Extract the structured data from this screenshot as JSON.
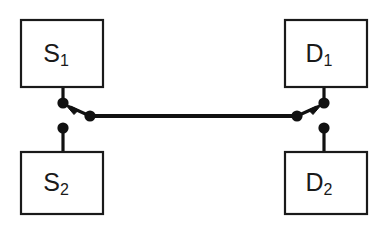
{
  "diagram": {
    "type": "schematic-switch-network",
    "background_color": "#ffffff",
    "line_color": "#111111",
    "box_stroke_color": "#1a1a1a",
    "box_fill_color": "#ffffff",
    "nodes": [
      {
        "id": "s1",
        "label_base": "S",
        "label_sub": "1",
        "label_full": "S1",
        "role": "source",
        "position": "top-left",
        "x": 21,
        "y": 20,
        "width": 82,
        "height": 67
      },
      {
        "id": "d1",
        "label_base": "D",
        "label_sub": "1",
        "label_full": "D1",
        "role": "destination",
        "position": "top-right",
        "x": 285,
        "y": 20,
        "width": 82,
        "height": 67
      },
      {
        "id": "s2",
        "label_base": "S",
        "label_sub": "2",
        "label_full": "S2",
        "role": "source",
        "position": "bottom-left",
        "x": 21,
        "y": 152,
        "width": 82,
        "height": 62
      },
      {
        "id": "d2",
        "label_base": "D",
        "label_sub": "2",
        "label_full": "D2",
        "role": "destination",
        "position": "bottom-right",
        "x": 285,
        "y": 152,
        "width": 82,
        "height": 62
      }
    ],
    "terminals": [
      {
        "id": "s1-terminal",
        "cx": 63,
        "cy": 103,
        "r": 5.4,
        "attached_to": "s1"
      },
      {
        "id": "s2-terminal",
        "cx": 63,
        "cy": 128,
        "r": 5.4,
        "attached_to": "s2"
      },
      {
        "id": "bus-left-terminal",
        "cx": 90,
        "cy": 116,
        "r": 5.4,
        "attached_to": "bus"
      },
      {
        "id": "bus-right-terminal",
        "cx": 297,
        "cy": 116,
        "r": 5.4,
        "attached_to": "bus"
      },
      {
        "id": "d1-terminal",
        "cx": 324,
        "cy": 103,
        "r": 5.4,
        "attached_to": "d1"
      },
      {
        "id": "d2-terminal",
        "cx": 324,
        "cy": 128,
        "r": 5.4,
        "attached_to": "d2"
      }
    ],
    "wires": [
      {
        "id": "s1-stem",
        "from_x": 63,
        "from_y": 87,
        "to_x": 63,
        "to_y": 103
      },
      {
        "id": "s2-stem",
        "from_x": 63,
        "from_y": 128,
        "to_x": 63,
        "to_y": 152
      },
      {
        "id": "d1-stem",
        "from_x": 324,
        "from_y": 87,
        "to_x": 324,
        "to_y": 103
      },
      {
        "id": "d2-stem",
        "from_x": 324,
        "from_y": 128,
        "to_x": 324,
        "to_y": 152
      },
      {
        "id": "bus",
        "from_x": 90,
        "from_y": 116,
        "to_x": 297,
        "to_y": 116
      }
    ],
    "switches": [
      {
        "id": "left-switch",
        "selected_node": "s1",
        "alternate_node": "s2",
        "blade_from_x": 90,
        "blade_from_y": 116,
        "blade_to_x": 64,
        "blade_to_y": 104,
        "arrow_tip_x": 66,
        "arrow_tip_y": 105
      },
      {
        "id": "right-switch",
        "selected_node": "d1",
        "alternate_node": "d2",
        "blade_from_x": 297,
        "blade_from_y": 116,
        "blade_to_x": 323,
        "blade_to_y": 104,
        "arrow_tip_x": 321,
        "arrow_tip_y": 105
      }
    ],
    "connection_summary": "S1 connected to D1 through closed switch blades"
  }
}
